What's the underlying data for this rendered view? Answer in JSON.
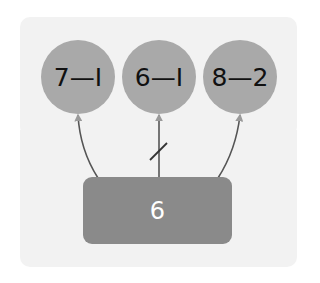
{
  "diagram": {
    "top_nodes": [
      {
        "label": "7—I",
        "expression": "7-1"
      },
      {
        "label": "6—I",
        "expression": "6-1"
      },
      {
        "label": "8—2",
        "expression": "8-2"
      }
    ],
    "bottom_node": {
      "label": "6"
    },
    "links": [
      {
        "from": "bottom",
        "to": 0,
        "crossed": false
      },
      {
        "from": "bottom",
        "to": 1,
        "crossed": true
      },
      {
        "from": "bottom",
        "to": 2,
        "crossed": false
      }
    ],
    "colors": {
      "background": "#f2f2f2",
      "circle": "#a9a9a9",
      "box": "#8a8a8a",
      "line": "#555555"
    }
  }
}
